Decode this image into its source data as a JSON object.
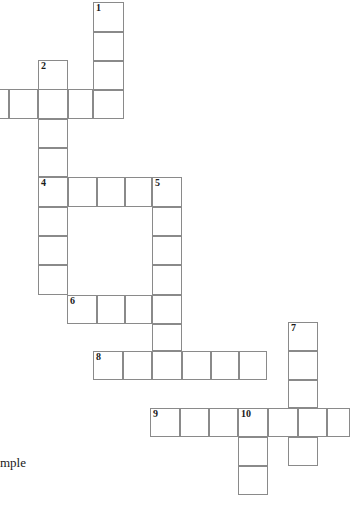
{
  "page": {
    "background_color": "#ffffff",
    "cell_border_color": "#8a8a8a",
    "cell_fill_color": "#ffffff",
    "width": 350,
    "height": 508
  },
  "caption": {
    "text": "mple",
    "note_full_word_clipped": "mple",
    "x": 0,
    "y": 455
  },
  "grid": {
    "cell_size": 29,
    "origin_x": 9,
    "origin_y": 2,
    "columns_visible": 12,
    "rows_visible": 17,
    "clue_numbers": [
      1,
      2,
      4,
      5,
      6,
      7,
      8,
      9,
      10
    ],
    "cells": [
      {
        "x": 93,
        "y": 2,
        "w": 31,
        "h": 30,
        "num": "1"
      },
      {
        "x": 93,
        "y": 32,
        "w": 31,
        "h": 29,
        "num": ""
      },
      {
        "x": 93,
        "y": 61,
        "w": 31,
        "h": 29,
        "num": ""
      },
      {
        "x": 93,
        "y": 90,
        "w": 31,
        "h": 29,
        "num": ""
      },
      {
        "x": 38,
        "y": 60,
        "w": 30,
        "h": 30,
        "num": "2"
      },
      {
        "x": -20,
        "y": 89,
        "w": 29,
        "h": 30,
        "num": ""
      },
      {
        "x": 9,
        "y": 89,
        "w": 29,
        "h": 30,
        "num": ""
      },
      {
        "x": 38,
        "y": 89,
        "w": 30,
        "h": 30,
        "num": ""
      },
      {
        "x": 68,
        "y": 89,
        "w": 25,
        "h": 30,
        "num": ""
      },
      {
        "x": 38,
        "y": 119,
        "w": 30,
        "h": 29,
        "num": ""
      },
      {
        "x": 38,
        "y": 148,
        "w": 30,
        "h": 29,
        "num": ""
      },
      {
        "x": 38,
        "y": 177,
        "w": 30,
        "h": 30,
        "num": "4"
      },
      {
        "x": 68,
        "y": 177,
        "w": 29,
        "h": 30,
        "num": ""
      },
      {
        "x": 97,
        "y": 177,
        "w": 28,
        "h": 30,
        "num": ""
      },
      {
        "x": 125,
        "y": 177,
        "w": 27,
        "h": 30,
        "num": ""
      },
      {
        "x": 152,
        "y": 177,
        "w": 30,
        "h": 30,
        "num": "5"
      },
      {
        "x": 38,
        "y": 207,
        "w": 30,
        "h": 29,
        "num": ""
      },
      {
        "x": 38,
        "y": 236,
        "w": 30,
        "h": 29,
        "num": ""
      },
      {
        "x": 38,
        "y": 265,
        "w": 30,
        "h": 30,
        "num": ""
      },
      {
        "x": 152,
        "y": 207,
        "w": 30,
        "h": 29,
        "num": ""
      },
      {
        "x": 152,
        "y": 236,
        "w": 30,
        "h": 29,
        "num": ""
      },
      {
        "x": 152,
        "y": 265,
        "w": 30,
        "h": 30,
        "num": ""
      },
      {
        "x": 67,
        "y": 295,
        "w": 30,
        "h": 29,
        "num": "6"
      },
      {
        "x": 97,
        "y": 295,
        "w": 28,
        "h": 29,
        "num": ""
      },
      {
        "x": 125,
        "y": 295,
        "w": 27,
        "h": 29,
        "num": ""
      },
      {
        "x": 152,
        "y": 295,
        "w": 30,
        "h": 29,
        "num": ""
      },
      {
        "x": 152,
        "y": 324,
        "w": 30,
        "h": 27,
        "num": ""
      },
      {
        "x": 288,
        "y": 322,
        "w": 30,
        "h": 29,
        "num": "7"
      },
      {
        "x": 288,
        "y": 351,
        "w": 30,
        "h": 29,
        "num": ""
      },
      {
        "x": 288,
        "y": 380,
        "w": 30,
        "h": 28,
        "num": ""
      },
      {
        "x": 288,
        "y": 408,
        "w": 30,
        "h": 29,
        "num": ""
      },
      {
        "x": 288,
        "y": 437,
        "w": 30,
        "h": 29,
        "num": ""
      },
      {
        "x": 93,
        "y": 351,
        "w": 30,
        "h": 29,
        "num": "8"
      },
      {
        "x": 123,
        "y": 351,
        "w": 29,
        "h": 29,
        "num": ""
      },
      {
        "x": 152,
        "y": 351,
        "w": 30,
        "h": 29,
        "num": ""
      },
      {
        "x": 182,
        "y": 351,
        "w": 29,
        "h": 29,
        "num": ""
      },
      {
        "x": 211,
        "y": 351,
        "w": 28,
        "h": 29,
        "num": ""
      },
      {
        "x": 239,
        "y": 351,
        "w": 28,
        "h": 29,
        "num": ""
      },
      {
        "x": 150,
        "y": 408,
        "w": 30,
        "h": 29,
        "num": "9"
      },
      {
        "x": 180,
        "y": 408,
        "w": 29,
        "h": 29,
        "num": ""
      },
      {
        "x": 209,
        "y": 408,
        "w": 29,
        "h": 29,
        "num": ""
      },
      {
        "x": 238,
        "y": 408,
        "w": 30,
        "h": 29,
        "num": "10"
      },
      {
        "x": 268,
        "y": 408,
        "w": 30,
        "h": 29,
        "num": ""
      },
      {
        "x": 298,
        "y": 408,
        "w": 29,
        "h": 29,
        "num": ""
      },
      {
        "x": 327,
        "y": 408,
        "w": 23,
        "h": 29,
        "num": ""
      },
      {
        "x": 238,
        "y": 437,
        "w": 30,
        "h": 29,
        "num": ""
      },
      {
        "x": 238,
        "y": 466,
        "w": 30,
        "h": 29,
        "num": ""
      }
    ]
  }
}
